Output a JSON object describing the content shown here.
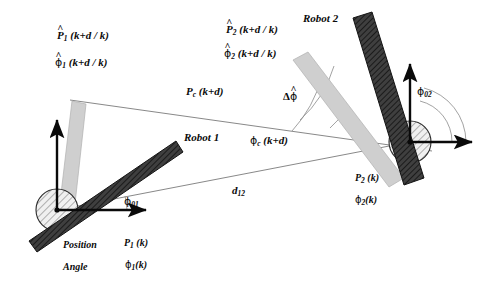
{
  "figure": {
    "type": "robot-coordination-geometry-diagram",
    "background": "#ffffff",
    "ink": "#0a0a0a",
    "robot_body_color": "#3a3a3a",
    "ghost_body_color": "#c9c9c9",
    "hub_color": "#e8e8e8"
  },
  "labels": {
    "robot1_title": "Robot  1",
    "robot2_title": "Robot  2",
    "r1_pred_pos_sym": "P",
    "r1_pred_pos_sub": "1",
    "r1_pred_pos_arg": "(k+d / k)",
    "r1_pred_ang_sym": "ϕ",
    "r1_pred_ang_sub": "1",
    "r1_pred_ang_arg": "(k+d / k)",
    "r2_pred_pos_sym": "P",
    "r2_pred_pos_sub": "2",
    "r2_pred_pos_arg": "(k+d / k)",
    "r2_pred_ang_sym": "ϕ",
    "r2_pred_ang_sub": "2",
    "r2_pred_ang_arg": "(k+d / k)",
    "centroid_pos_sym": "P",
    "centroid_pos_sub": "c",
    "centroid_pos_arg": "(k+d)",
    "centroid_ang_sym": "ϕ",
    "centroid_ang_sub": "c",
    "centroid_ang_arg": "(k+d)",
    "delta_phi_prefix": "Δ",
    "delta_phi_sym": "ϕ",
    "phi01_sym": "ϕ",
    "phi01_sub": "01",
    "phi02_sym": "ϕ",
    "phi02_sub": "02",
    "distance_sym": "d",
    "distance_sub": "12",
    "position_word": "Position",
    "angle_word": "Angle",
    "r1_pos_sym": "P",
    "r1_pos_sub": "1",
    "r1_pos_arg": "(k)",
    "r1_ang_sym": "ϕ",
    "r1_ang_sub": "1",
    "r1_ang_arg": "(k)",
    "r2_pos_sym": "P",
    "r2_pos_sub": "2",
    "r2_pos_arg": "(k)",
    "r2_ang_sym": "ϕ",
    "r2_ang_sub": "2",
    "r2_ang_arg": "(k)",
    "hat_glyph": "^"
  },
  "geometry": {
    "robot1_hub": {
      "cx": 57,
      "cy": 210,
      "r": 21
    },
    "robot2_hub": {
      "cx": 410,
      "cy": 142,
      "r": 21
    },
    "baseline": {
      "x1": 57,
      "y1": 210,
      "x2": 410,
      "y2": 142
    },
    "pc_line": {
      "x1": 72,
      "y1": 101,
      "x2": 430,
      "y2": 150
    },
    "r1_axis_x": {
      "x1": 57,
      "y1": 210,
      "x2": 150,
      "y2": 210
    },
    "r1_axis_y": {
      "x1": 57,
      "y1": 210,
      "x2": 57,
      "y2": 115
    },
    "r2_axis_x": {
      "x1": 410,
      "y1": 142,
      "x2": 470,
      "y2": 142
    },
    "r2_axis_y": {
      "x1": 410,
      "y1": 142,
      "x2": 410,
      "y2": 60
    },
    "phi01_arc_deg": 11,
    "phi02_arc_deg": 74,
    "delta_phi_arc_deg": 48
  }
}
